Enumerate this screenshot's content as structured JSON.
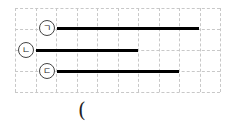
{
  "diagram": {
    "grid": {
      "columns": 10,
      "rows": 4,
      "cell_width": 20.5,
      "cell_height": 21,
      "line_color": "#c8c8c8",
      "line_style": "dashed"
    },
    "bars": [
      {
        "label": "ㄱ",
        "circled_label": "㉠",
        "start_col": 2,
        "end_col": 9,
        "length_units": 7,
        "row_line": 1
      },
      {
        "label": "ㄴ",
        "circled_label": "㉡",
        "start_col": 1,
        "end_col": 6,
        "length_units": 5,
        "row_line": 2
      },
      {
        "label": "ㄷ",
        "circled_label": "㉢",
        "start_col": 2,
        "end_col": 8,
        "length_units": 6,
        "row_line": 3
      }
    ],
    "answer_blank": "("
  }
}
